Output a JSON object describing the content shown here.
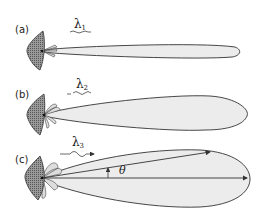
{
  "panels": [
    {
      "id": "a",
      "label": "(a)",
      "wavelength": "λ",
      "wavelength_sub": "1"
    },
    {
      "id": "b",
      "label": "(b)",
      "wavelength": "λ",
      "wavelength_sub": "2"
    },
    {
      "id": "c",
      "label": "(c)",
      "wavelength": "λ",
      "wavelength_sub": "3",
      "angle_label": "θ"
    }
  ],
  "colors": {
    "lobe_fill": "#ececec",
    "outline": "#333333",
    "reflector_fill": "#8a8a8a"
  }
}
